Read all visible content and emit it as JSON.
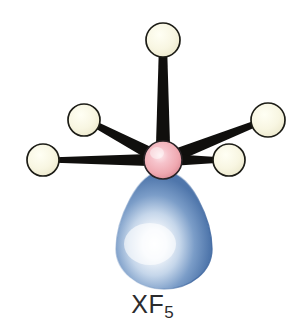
{
  "figure": {
    "kind": "molecular-geometry-diagram",
    "formula_base": "XF",
    "formula_subscript": "5",
    "formula_full": "XF5",
    "background_color": "#ffffff",
    "width": 305,
    "height": 335
  },
  "colors": {
    "background": "#ffffff",
    "central_atom_fill": "#efa8b0",
    "central_atom_highlight": "#fbe2e6",
    "central_atom_shadow": "#c9737f",
    "central_atom_outline": "#2a2326",
    "outer_atom_fill": "#f7f5de",
    "outer_atom_highlight": "#fffff2",
    "outer_atom_shadow": "#ddd9b4",
    "outer_atom_outline": "#1c1c16",
    "bond": "#100f0d",
    "lobe_fill": "#5b82b4",
    "lobe_highlight": "#ffffff",
    "lobe_edge": "#3d6396",
    "label_text": "#2b2b2d"
  },
  "central_atom": {
    "name": "X",
    "cx": 163,
    "cy": 160,
    "r": 19
  },
  "lone_pair_lobe": {
    "name": "lone-pair",
    "direction": "down",
    "apex_x": 163,
    "apex_y": 172,
    "center_x": 164,
    "bottom_y": 288,
    "max_width": 96
  },
  "outer_atoms": [
    {
      "id": "top",
      "label": "F",
      "cx": 163,
      "cy": 40,
      "r": 17
    },
    {
      "id": "upper-left",
      "label": "F",
      "cx": 84,
      "cy": 120,
      "r": 16
    },
    {
      "id": "lower-left",
      "label": "F",
      "cx": 43,
      "cy": 160,
      "r": 16
    },
    {
      "id": "upper-right",
      "label": "F",
      "cx": 268,
      "cy": 120,
      "r": 17
    },
    {
      "id": "lower-right",
      "label": "F",
      "cx": 229,
      "cy": 160,
      "r": 16
    }
  ],
  "bonds": [
    {
      "id": "bond-top",
      "from": "X",
      "to": "top",
      "half_width_center": 7.5,
      "half_width_outer": 3.5
    },
    {
      "id": "bond-upper-left",
      "from": "X",
      "to": "upper-left",
      "half_width_center": 7.0,
      "half_width_outer": 2.5
    },
    {
      "id": "bond-lower-left",
      "from": "X",
      "to": "lower-left",
      "half_width_center": 6.5,
      "half_width_outer": 2.5
    },
    {
      "id": "bond-upper-right",
      "from": "X",
      "to": "upper-right",
      "half_width_center": 7.0,
      "half_width_outer": 2.5
    },
    {
      "id": "bond-lower-right",
      "from": "X",
      "to": "lower-right",
      "half_width_center": 6.5,
      "half_width_outer": 2.5
    }
  ]
}
